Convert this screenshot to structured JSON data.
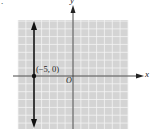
{
  "marker": ".",
  "axes": {
    "x_label": "x",
    "y_label": "y",
    "origin_label": "O"
  },
  "grid": {
    "x_range": [
      -7,
      7
    ],
    "y_range": [
      -7,
      7
    ],
    "step": 1,
    "background": "#d4d4d4",
    "line_color": "#f4f4f4"
  },
  "graph": {
    "type": "vertical-line",
    "equation": "x = -5",
    "point_label": "(−5, 0)",
    "point": [
      -5,
      0
    ]
  }
}
